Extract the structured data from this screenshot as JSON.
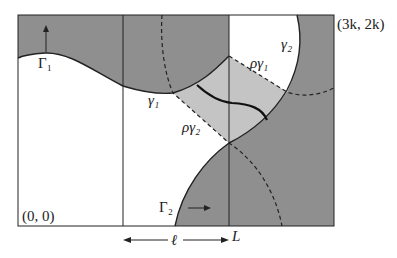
{
  "diagram": {
    "colors": {
      "dark_region": "#8f8f8f",
      "light_region": "#c4c4c4",
      "white_region": "#ffffff",
      "line": "#222222"
    },
    "labels": {
      "gamma_cap_1": "Γ₁",
      "gamma_cap_2": "Γ₂",
      "gamma_1": "γ₁",
      "gamma_2": "γ₂",
      "rho_gamma_1": "ργ₁",
      "rho_gamma_2": "ργ₂",
      "origin": "(0, 0)",
      "corner": "(3k, 2k)",
      "ell": "ℓ",
      "L": "L"
    }
  }
}
